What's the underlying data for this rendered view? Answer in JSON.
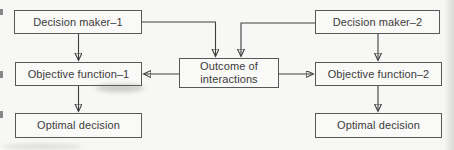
{
  "figure": {
    "type": "flowchart",
    "background_color": "#f7f7f5",
    "box_border_color": "#585858",
    "arrow_color": "#3f3f3f",
    "text_color": "#3c3c3c"
  },
  "nodes": {
    "decision_maker_1": {
      "label": "Decision maker–1"
    },
    "decision_maker_2": {
      "label": "Decision maker–2"
    },
    "objective_function_1": {
      "label": "Objective function–1"
    },
    "objective_function_2": {
      "label": "Objective function–2"
    },
    "outcome": {
      "lines": [
        "Outcome of",
        "interactions"
      ]
    },
    "optimal_decision_1": {
      "label": "Optimal decision"
    },
    "optimal_decision_2": {
      "label": "Optimal decision"
    }
  },
  "edges": [
    {
      "from": "decision_maker_1",
      "to": "objective_function_1"
    },
    {
      "from": "decision_maker_1",
      "to": "outcome"
    },
    {
      "from": "decision_maker_2",
      "to": "objective_function_2"
    },
    {
      "from": "decision_maker_2",
      "to": "outcome"
    },
    {
      "from": "outcome",
      "to": "objective_function_1"
    },
    {
      "from": "outcome",
      "to": "objective_function_2"
    },
    {
      "from": "objective_function_1",
      "to": "optimal_decision_1"
    },
    {
      "from": "objective_function_2",
      "to": "optimal_decision_2"
    }
  ]
}
